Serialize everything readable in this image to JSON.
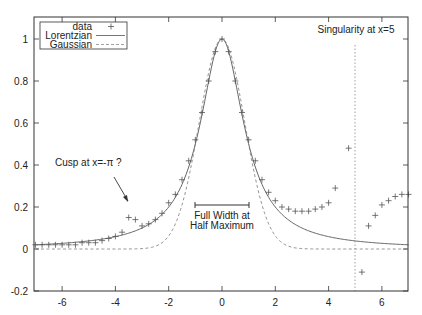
{
  "chart_data": {
    "type": "line",
    "title": "",
    "xlabel": "",
    "ylabel": "",
    "xlim": [
      -7,
      7
    ],
    "ylim": [
      -0.2,
      1.1
    ],
    "grid": false,
    "legend_position": "top-left",
    "x_ticks": [
      "-6",
      "-4",
      "-2",
      "0",
      "2",
      "4",
      "6"
    ],
    "y_ticks": [
      "-0.2",
      "0",
      "0.2",
      "0.4",
      "0.6",
      "0.8",
      "1"
    ],
    "series": [
      {
        "name": "data",
        "style": "points (+)",
        "x": [
          -7,
          -6.75,
          -6.5,
          -6.25,
          -6,
          -5.75,
          -5.5,
          -5.25,
          -5,
          -4.75,
          -4.5,
          -4.25,
          -4,
          -3.75,
          -3.5,
          -3.25,
          -3,
          -2.75,
          -2.5,
          -2.25,
          -2,
          -1.75,
          -1.5,
          -1.25,
          -1,
          -0.75,
          -0.5,
          -0.25,
          0,
          0.25,
          0.5,
          0.75,
          1,
          1.25,
          1.5,
          1.75,
          2,
          2.25,
          2.5,
          2.75,
          3,
          3.25,
          3.5,
          3.75,
          4,
          4.25,
          4.75,
          5.25,
          5.5,
          5.75,
          6,
          6.25,
          6.5,
          6.75,
          7
        ],
        "y": [
          0.02,
          0.02,
          0.02,
          0.02,
          0.02,
          0.02,
          0.02,
          0.03,
          0.03,
          0.03,
          0.04,
          0.05,
          0.06,
          0.08,
          0.15,
          0.14,
          0.11,
          0.12,
          0.14,
          0.17,
          0.22,
          0.26,
          0.33,
          0.42,
          0.52,
          0.65,
          0.8,
          0.94,
          1.0,
          0.94,
          0.8,
          0.65,
          0.52,
          0.42,
          0.33,
          0.27,
          0.23,
          0.2,
          0.19,
          0.18,
          0.18,
          0.18,
          0.19,
          0.2,
          0.22,
          0.29,
          0.48,
          -0.11,
          0.11,
          0.16,
          0.21,
          0.23,
          0.25,
          0.26,
          0.26
        ]
      },
      {
        "name": "Lorentzian",
        "style": "solid line",
        "formula": "1/(1+x^2)"
      },
      {
        "name": "Gaussian",
        "style": "dashed line",
        "formula": "exp(-x^2 ln2)"
      }
    ],
    "annotations": [
      {
        "text": "Singularity at x=5",
        "x": 5,
        "style": "vertical dotted line"
      },
      {
        "text": "Cusp at x=-π ?",
        "arrow_to": [
          -3.3,
          0.17
        ]
      },
      {
        "text": "Full Width at Half Maximum",
        "bar_from": -1,
        "bar_to": 1,
        "y": 0.5
      }
    ]
  },
  "legend": {
    "data": "data",
    "lorentzian": "Lorentzian",
    "gaussian": "Gaussian"
  },
  "annotations": {
    "singularity": "Singularity at x=5",
    "cusp": "Cusp at x=-π ?",
    "fwhm_line1": "Full Width at",
    "fwhm_line2": "Half Maximum"
  }
}
